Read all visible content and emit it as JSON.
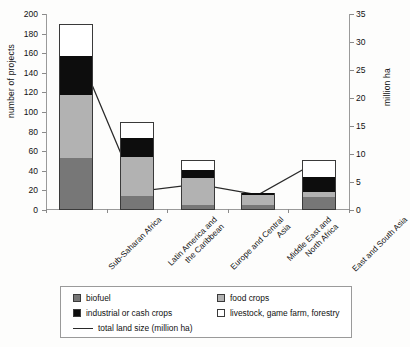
{
  "chart_data": {
    "type": "bar",
    "title": "",
    "xlabel": "",
    "ylabel": "number of projects",
    "y2label": "million ha",
    "ylim": [
      0,
      200
    ],
    "y2lim": [
      0,
      35
    ],
    "yticks": [
      0,
      20,
      40,
      60,
      80,
      100,
      120,
      140,
      160,
      180,
      200
    ],
    "y2ticks": [
      0,
      5,
      10,
      15,
      20,
      25,
      30,
      35
    ],
    "grid": false,
    "stacked": true,
    "legend_position": "below-axes",
    "categories": [
      "Sub-Saharan Africa",
      "Latin America and\nthe Caribbean",
      "Europe and Central\nAsia",
      "Middle East and\nNorth Africa",
      "East and South Asia"
    ],
    "series": [
      {
        "name": "biofuel",
        "color": "#777777",
        "values": [
          53,
          14,
          5,
          5,
          13
        ]
      },
      {
        "name": "food crops",
        "color": "#b2b2b2",
        "values": [
          64,
          40,
          28,
          10,
          5
        ]
      },
      {
        "name": "industrial or cash crops",
        "color": "#0d0d0d",
        "values": [
          40,
          19,
          8,
          2,
          16
        ]
      },
      {
        "name": "livestock, game farm, forestry",
        "color": "#ffffff",
        "values": [
          33,
          17,
          10,
          0,
          17
        ]
      }
    ],
    "totals": [
      190,
      90,
      51,
      17,
      51
    ],
    "line_series": {
      "name": "total land size (million ha)",
      "color": "#2a2a2a",
      "axis": "right",
      "values": [
        29.0,
        3.3,
        4.6,
        2.7,
        8.8
      ]
    }
  },
  "axes": {
    "left_title": "number of projects",
    "right_title": "million ha"
  },
  "legend": {
    "items": [
      {
        "label": "biofuel",
        "swatch": "sw-biofuel"
      },
      {
        "label": "food crops",
        "swatch": "sw-food"
      },
      {
        "label": "industrial or cash crops",
        "swatch": "sw-industrial"
      },
      {
        "label": "livestock, game farm, forestry",
        "swatch": "sw-livestock"
      },
      {
        "label": "total land size (million ha)",
        "swatch": "sw-line"
      }
    ]
  }
}
